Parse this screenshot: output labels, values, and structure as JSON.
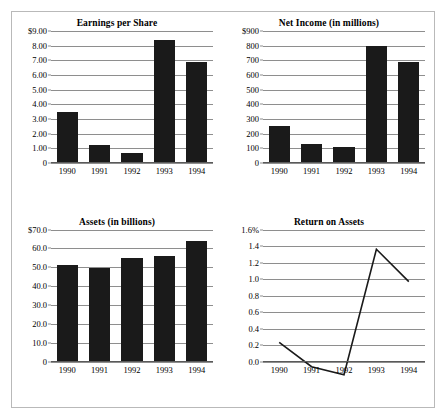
{
  "figure": {
    "background": "#ffffff",
    "border_color": "#b9b9b9",
    "bar_color": "#1a1a1a",
    "gridline_color": "#8e8e8e",
    "line_color": "#1a1a1a"
  },
  "chart_data": [
    {
      "type": "bar",
      "title": "Earnings per Share",
      "xlabel": "",
      "ylabel": "",
      "categories": [
        "1990",
        "1991",
        "1992",
        "1993",
        "1994"
      ],
      "values": [
        3.45,
        1.15,
        0.6,
        8.4,
        6.9
      ],
      "ylim": [
        0,
        9
      ],
      "yticks": [
        0,
        1,
        2,
        3,
        4,
        5,
        6,
        7,
        8,
        9
      ],
      "ytick_labels": [
        "0",
        "1.00",
        "2.00",
        "3.00",
        "4.00",
        "5.00",
        "6.00",
        "7.00",
        "8.00",
        "$9.00"
      ],
      "grid": true,
      "legend": "none"
    },
    {
      "type": "bar",
      "title": "Net Income (in millions)",
      "xlabel": "",
      "ylabel": "",
      "categories": [
        "1990",
        "1991",
        "1992",
        "1993",
        "1994"
      ],
      "values": [
        250,
        122,
        100,
        800,
        685
      ],
      "ylim": [
        0,
        900
      ],
      "yticks": [
        0,
        100,
        200,
        300,
        400,
        500,
        600,
        700,
        800,
        900
      ],
      "ytick_labels": [
        "0",
        "100",
        "200",
        "300",
        "400",
        "500",
        "600",
        "700",
        "800",
        "$900"
      ],
      "grid": true,
      "legend": "none"
    },
    {
      "type": "bar",
      "title": "Assets (in billions)",
      "xlabel": "",
      "ylabel": "",
      "categories": [
        "1990",
        "1991",
        "1992",
        "1993",
        "1994"
      ],
      "values": [
        51.0,
        49.3,
        54.7,
        56.0,
        64.0
      ],
      "ylim": [
        0,
        70
      ],
      "yticks": [
        0,
        10,
        20,
        30,
        40,
        50,
        60,
        70
      ],
      "ytick_labels": [
        "0",
        "10.0",
        "20.0",
        "30.0",
        "40.0",
        "50.0",
        "60.0",
        "$70.0"
      ],
      "grid": true,
      "legend": "none"
    },
    {
      "type": "line",
      "title": "Return on Assets",
      "xlabel": "",
      "ylabel": "",
      "categories": [
        "1990",
        "1991",
        "1992",
        "1993",
        "1994"
      ],
      "values": [
        0.49,
        0.25,
        0.17,
        1.41,
        1.09
      ],
      "ylim": [
        0,
        1.6
      ],
      "yticks": [
        0.0,
        0.2,
        0.4,
        0.6,
        0.8,
        1.0,
        1.2,
        1.4,
        1.6
      ],
      "ytick_labels": [
        "0.0",
        "0.2",
        "0.4",
        "0.6",
        "0.8",
        "1.0",
        "1.2",
        "1.4",
        "1.6%"
      ],
      "grid": true,
      "legend": "none"
    }
  ]
}
